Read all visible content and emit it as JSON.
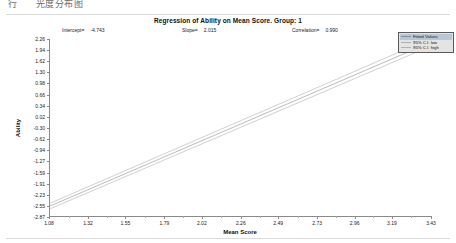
{
  "topbar": {
    "text_left": "行",
    "text_right": "光度分布图"
  },
  "chart_data": {
    "type": "line",
    "title": "Regression of Ability on Mean Score.  Group: 1",
    "xlabel": "Mean Score",
    "ylabel": "Ability",
    "xlim": [
      1.08,
      3.43
    ],
    "ylim": [
      -2.87,
      2.26
    ],
    "grid": false,
    "legend_position": "top-right",
    "annotations": {
      "intercept_label": "Intercept=",
      "intercept_value": "-4.743",
      "slope_label": "Slope=",
      "slope_value": "2.015",
      "correlation_label": "Correlation=",
      "correlation_value": "0.990"
    },
    "xticks": [
      1.08,
      1.32,
      1.55,
      1.79,
      2.02,
      2.26,
      2.49,
      2.73,
      2.96,
      3.19,
      3.43
    ],
    "xticklabels": [
      "1.08",
      "1.32",
      "1.55",
      "1.79",
      "2.02",
      "2.26",
      "2.49",
      "2.73",
      "2.96",
      "3.19",
      "3.43"
    ],
    "yticks": [
      2.26,
      1.94,
      1.62,
      1.3,
      0.98,
      0.66,
      0.34,
      0.02,
      -0.3,
      -0.62,
      -0.94,
      -1.27,
      -1.59,
      -1.91,
      -2.23,
      -2.55,
      -2.87
    ],
    "yticklabels": [
      "2.26",
      "1.94",
      "1.62",
      "1.30",
      "0.98",
      "0.66",
      "0.34",
      "0.02",
      "-0.30",
      "-0.62",
      "-0.94",
      "-1.27",
      "-1.59",
      "-1.91",
      "-2.23",
      "-2.55",
      "-2.87"
    ],
    "series": [
      {
        "name": "Fitted Values",
        "color": "#8d8d8d",
        "x": [
          1.08,
          3.43
        ],
        "values": [
          -2.567,
          2.17
        ]
      },
      {
        "name": "95% C.I. low",
        "color": "#b0b0b0",
        "x": [
          1.08,
          3.43
        ],
        "values": [
          -2.647,
          2.06
        ]
      },
      {
        "name": "95% C.I. high",
        "color": "#b0b0b0",
        "x": [
          1.08,
          3.43
        ],
        "values": [
          -2.487,
          2.28
        ]
      }
    ],
    "legend": [
      {
        "label": "Fitted Values",
        "selected": true
      },
      {
        "label": "95% C.I. low",
        "selected": false
      },
      {
        "label": "95% C.I. high",
        "selected": false
      }
    ]
  }
}
